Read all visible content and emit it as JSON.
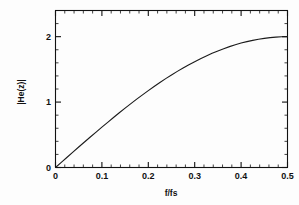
{
  "figure": {
    "background_color": "#fdfdfd",
    "foreground_color": "#111111"
  },
  "chart_data": {
    "type": "line",
    "title": "",
    "subtitle": "",
    "xlabel": "f/fs",
    "ylabel": "|He(z)|",
    "xlim": [
      0,
      0.5
    ],
    "ylim": [
      0,
      2.4
    ],
    "grid": false,
    "legend": null,
    "legend_position": "none",
    "x_ticks": [
      0,
      0.1,
      0.2,
      0.3,
      0.4,
      0.5
    ],
    "x_tick_labels": [
      "0",
      "0.1",
      "0.2",
      "0.3",
      "0.4",
      "0.5"
    ],
    "x_minor_tick_step": 0.02,
    "y_ticks": [
      0,
      1,
      2
    ],
    "y_tick_labels": [
      "0",
      "1",
      "2"
    ],
    "y_minor_tick_step": 0.2,
    "series": [
      {
        "name": "|He(z)|",
        "color": "#1b1b1b",
        "x": [
          0,
          0.0125,
          0.025,
          0.0375,
          0.05,
          0.0625,
          0.075,
          0.0875,
          0.1,
          0.1125,
          0.125,
          0.1375,
          0.15,
          0.1625,
          0.175,
          0.1875,
          0.2,
          0.2125,
          0.225,
          0.2375,
          0.25,
          0.2625,
          0.275,
          0.2875,
          0.3,
          0.3125,
          0.325,
          0.3375,
          0.35,
          0.3625,
          0.375,
          0.3875,
          0.4,
          0.4125,
          0.425,
          0.4375,
          0.45,
          0.4625,
          0.475,
          0.4875,
          0.5
        ],
        "y": [
          0.0,
          0.078,
          0.157,
          0.235,
          0.313,
          0.39,
          0.466,
          0.541,
          0.618,
          0.691,
          0.765,
          0.837,
          0.908,
          0.977,
          1.045,
          1.111,
          1.176,
          1.239,
          1.3,
          1.359,
          1.414,
          1.469,
          1.521,
          1.571,
          1.618,
          1.663,
          1.705,
          1.745,
          1.782,
          1.816,
          1.848,
          1.876,
          1.902,
          1.924,
          1.943,
          1.96,
          1.974,
          1.985,
          1.993,
          1.998,
          2.0
        ]
      }
    ],
    "annotations": []
  }
}
